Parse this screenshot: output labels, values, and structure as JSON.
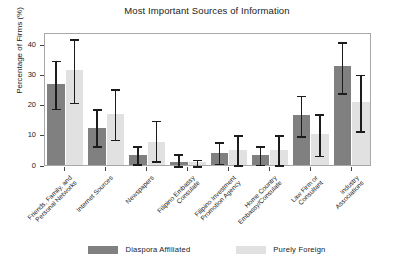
{
  "chart_data": {
    "type": "bar",
    "title": "Most Important Sources of Information",
    "xlabel": "",
    "ylabel": "Percentage of Firms (%)",
    "ylim": [
      0,
      44
    ],
    "yticks": [
      0,
      10,
      20,
      30,
      40
    ],
    "grid": false,
    "legend_position": "bottom",
    "categories": [
      "Friends, Family, and\nPersonal Networks",
      "Internet Sources",
      "Newspapers",
      "Filipino Embassy\nConsulate",
      "Filipino Investment\nPromotion Agency",
      "Home Country\nEmbassy/Consulate",
      "Law Firm or\nConsultant",
      "Industry\nAssociations"
    ],
    "series": [
      {
        "name": "Diaspora Affiliated",
        "color": "#808080",
        "values": [
          26.9,
          12.4,
          3.2,
          1.0,
          4.1,
          3.2,
          16.7,
          32.7
        ],
        "err_low": [
          19.0,
          6.6,
          0.6,
          0.0,
          0.8,
          0.4,
          9.9,
          24.2
        ],
        "err_high": [
          35.0,
          18.8,
          6.6,
          4.0,
          8.0,
          6.6,
          23.3,
          41.0
        ]
      },
      {
        "name": "Purely Foreign",
        "color": "#e1e1e1",
        "values": [
          31.3,
          17.0,
          7.5,
          1.0,
          5.0,
          5.0,
          10.1,
          20.9
        ],
        "err_low": [
          21.0,
          8.8,
          1.6,
          0.0,
          0.3,
          0.3,
          3.4,
          11.6
        ],
        "err_high": [
          42.0,
          25.5,
          15.0,
          2.1,
          10.2,
          10.2,
          17.2,
          30.3
        ]
      }
    ]
  },
  "legend": {
    "items": [
      {
        "label": "Diaspora Affiliated"
      },
      {
        "label": "Purely Foreign"
      }
    ]
  }
}
